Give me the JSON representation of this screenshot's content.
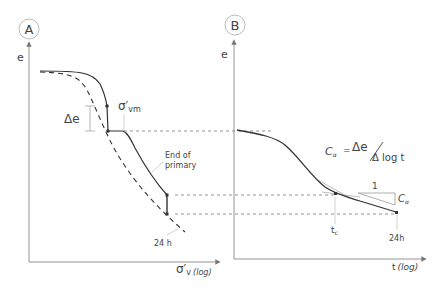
{
  "panels": {
    "a": {
      "badge": "A",
      "y_label": "e",
      "x_label_main": "σ′",
      "x_label_sub": "v",
      "x_label_scale": "(log)",
      "annotations": {
        "delta_e": "Δe",
        "sigma_vm_main": "σ′",
        "sigma_vm_sub": "vm",
        "end_of_primary_line1": "End of",
        "end_of_primary_line2": "primary",
        "label_24h": "24 h"
      }
    },
    "b": {
      "badge": "B",
      "y_label": "e",
      "x_label_main": "t",
      "x_label_scale": "(log)",
      "formula": {
        "lhs": "C",
        "lhs_sub": "α",
        "eq": "=",
        "numerator": "Δe",
        "denominator": "Δ log t"
      },
      "slope_triangle": {
        "run": "1",
        "rise": "C",
        "rise_sub": "α"
      },
      "annotations": {
        "t_c": "t",
        "t_c_sub": "c",
        "label_24h": "24h"
      }
    }
  },
  "colors": {
    "curve": "#333333",
    "axis": "#777777",
    "dashed": "#555555",
    "text": "#444444"
  }
}
